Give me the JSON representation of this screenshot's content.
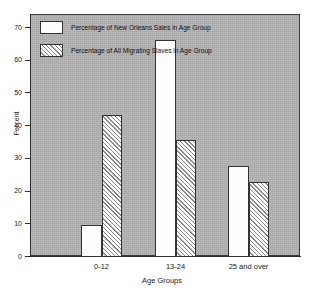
{
  "chart_data": {
    "type": "bar",
    "title": "",
    "xlabel": "Age Groups",
    "ylabel": "Percent",
    "categories": [
      "0-12",
      "13-24",
      "25 and over"
    ],
    "series": [
      {
        "name": "Percentage of New Orleans Sales in Age Group",
        "fill": "solid",
        "values": [
          9.5,
          66,
          27.5
        ]
      },
      {
        "name": "Percentage of All Migrating Slaves in Age Group",
        "fill": "hatched",
        "values": [
          43,
          35.5,
          22.5
        ]
      }
    ],
    "ylim": [
      0,
      74
    ],
    "yticks": [
      0,
      10,
      20,
      30,
      40,
      50,
      60,
      70
    ],
    "ytick_labels": [
      "0",
      "10",
      "20",
      "30",
      "40",
      "50",
      "60",
      "70"
    ],
    "grid": false,
    "legend_position": "top-left",
    "legend": [
      "Percentage of New Orleans Sales in Age Group",
      "Percentage of All Migrating Slaves in Age Group"
    ],
    "colors": {
      "panel_background": "#b3b3b3",
      "bar_fill": "#fdfdfd",
      "bar_edge": "#333333",
      "hatch_line": "#8a8a8a",
      "axis": "#2b2b2b",
      "text": "#1a1a1a",
      "page_background": "#ffffff"
    }
  }
}
